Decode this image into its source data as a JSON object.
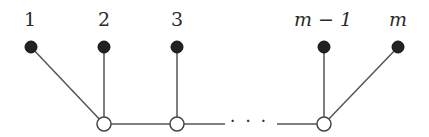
{
  "diagram": {
    "type": "tree-graph",
    "colors": {
      "edge": "#555555",
      "filled_node": "#222222",
      "open_node_fill": "#ffffff",
      "open_node_stroke": "#444444",
      "label": "#2b2b2b"
    },
    "leaves": [
      {
        "id": "1",
        "label": "1",
        "x": 31,
        "y": 47,
        "label_x": 30,
        "italic": false,
        "parent": "a"
      },
      {
        "id": "2",
        "label": "2",
        "x": 104,
        "y": 47,
        "label_x": 104,
        "italic": false,
        "parent": "a"
      },
      {
        "id": "3",
        "label": "3",
        "x": 177,
        "y": 47,
        "label_x": 177,
        "italic": false,
        "parent": "b"
      },
      {
        "id": "m-1",
        "label": "m − 1",
        "x": 324,
        "y": 47,
        "label_x": 323,
        "italic": true,
        "parent": "c"
      },
      {
        "id": "m",
        "label": "m",
        "x": 398,
        "y": 47,
        "label_x": 398,
        "italic": true,
        "parent": "c"
      }
    ],
    "spine_nodes": [
      {
        "id": "a",
        "x": 104,
        "y": 124
      },
      {
        "id": "b",
        "x": 177,
        "y": 124
      },
      {
        "id": "c",
        "x": 324,
        "y": 124
      }
    ],
    "spine_segments": [
      {
        "x1": 104,
        "x2": 177
      },
      {
        "x1": 177,
        "x2": 225
      },
      {
        "x1": 277,
        "x2": 324
      }
    ],
    "ellipsis": {
      "text": "· · ·",
      "x": 249,
      "y": 116
    }
  }
}
